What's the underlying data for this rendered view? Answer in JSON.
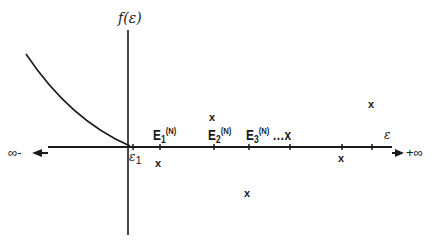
{
  "diagram": {
    "y_axis_label": "f(ε)",
    "x_axis_label": "ε",
    "origin_label": "ε",
    "origin_sub": "1",
    "left_infinity": "∞-",
    "right_infinity": "+∞",
    "eigen_labels": [
      {
        "base": "E",
        "sub": "1",
        "sup": "(N)"
      },
      {
        "base": "E",
        "sub": "2",
        "sup": "(N)"
      },
      {
        "base": "E",
        "sub": "3",
        "sup": "(N)",
        "suffix": "…x"
      }
    ],
    "x_marks": [
      "x",
      "x",
      "x",
      "x",
      "x"
    ],
    "colors": {
      "line": "#1a1a1a",
      "background": "#ffffff"
    }
  }
}
